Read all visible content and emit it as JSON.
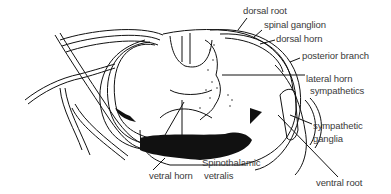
{
  "diagram": {
    "colors": {
      "ink": "#111111",
      "label": "#3a3a3a",
      "background": "#ffffff"
    },
    "labels": {
      "dorsal_root": "dorsal root",
      "spinal_ganglion": "spinal ganglion",
      "dorsal_horn": "dorsal horn",
      "posterior_branch": "posterior branch",
      "lateral_horn_line1": "lateral horn",
      "lateral_horn_line2": "sympathetics",
      "sympathetic_ganglia_line1": "sympathetic",
      "sympathetic_ganglia_line2": "ganglia",
      "spinothalamic_line1": "Spinothalamic",
      "spinothalamic_line2": "vetralis",
      "vetral_horn": "vetral horn",
      "ventral_root": "ventral root"
    }
  }
}
